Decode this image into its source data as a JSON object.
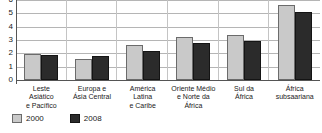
{
  "chart_data": {
    "type": "bar",
    "title": "",
    "subtitle": "",
    "xlabel": "",
    "ylabel": "",
    "ylim": [
      0,
      6
    ],
    "yticks": [
      0,
      1,
      2,
      3,
      4,
      5,
      6
    ],
    "ytick_labels": [
      "0",
      "1",
      "2",
      "3",
      "4",
      "5",
      "6"
    ],
    "grid": true,
    "legend_position": "bottom-left",
    "categories": [
      "Leste\nAsiático\ne Pacífico",
      "Europa e\nÁsia Central",
      "América\nLatina\ne Caribe",
      "Oriente Médio\ne Norte da\nÁfrica",
      "Sul da\nÁfrica",
      "África\nsubsaariana"
    ],
    "category_lines": [
      [
        "Leste",
        "Asiático",
        "e Pacífico"
      ],
      [
        "Europa e",
        "Ásia Central"
      ],
      [
        "América",
        "Latina",
        "e Caribe"
      ],
      [
        "Oriente Médio",
        "e Norte da",
        "África"
      ],
      [
        "Sul da",
        "África"
      ],
      [
        "África",
        "subsaariana"
      ]
    ],
    "series": [
      {
        "name": "2000",
        "color": "#c9c9c9",
        "values": [
          1.95,
          1.55,
          2.65,
          3.2,
          3.4,
          5.6
        ]
      },
      {
        "name": "2008",
        "color": "#2b2b2b",
        "values": [
          1.9,
          1.8,
          2.15,
          2.8,
          2.9,
          5.1
        ]
      }
    ]
  },
  "legend": {
    "items": [
      {
        "label": "2000",
        "color": "#c9c9c9"
      },
      {
        "label": "2008",
        "color": "#2b2b2b"
      }
    ]
  },
  "colors": {
    "series_2000": "#c9c9c9",
    "series_2008": "#2b2b2b",
    "gridline": "#b5b5b5",
    "axis": "#555555",
    "background": "#ffffff",
    "text": "#1a1a1a"
  }
}
